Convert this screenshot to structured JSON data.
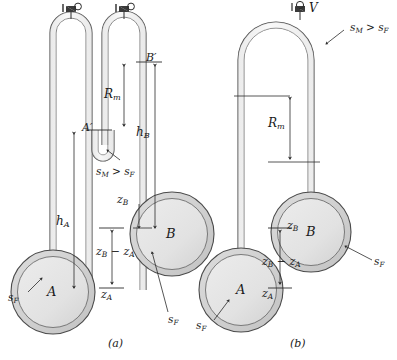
{
  "figure": {
    "title_caption_a": "(a)",
    "title_caption_b": "(b)",
    "fluid_note": "s_M > s_F",
    "valve_label": "V"
  },
  "panel_a": {
    "caption": "(a)",
    "spheres": [
      {
        "name": "sphere-a",
        "label": "A"
      },
      {
        "name": "sphere-b",
        "label": "B"
      }
    ],
    "labels": {
      "a_prime": "A′",
      "b_prime": "B′",
      "manometer_reading": "R",
      "manometer_reading_sub": "m",
      "h_a": "h",
      "h_a_sub": "A",
      "h_b": "h",
      "h_b_sub": "B",
      "z_b": "z",
      "z_b_sub": "B",
      "z_a": "z",
      "z_a_sub": "A",
      "z_diff": "z",
      "z_diff_sub1": "B",
      "z_diff_minus": " − ",
      "z_diff_z2": "z",
      "z_diff_sub2": "A",
      "s_m_gt_s_f_first": "s",
      "s_m_gt_s_f_sub1": "M",
      "s_m_gt_s_f_mid": " > ",
      "s_m_gt_s_f_second": "s",
      "s_m_gt_s_f_sub2": "F",
      "s_f_left": "s",
      "s_f_left_sub": "F",
      "s_f_right": "s",
      "s_f_right_sub": "F"
    }
  },
  "panel_b": {
    "caption": "(b)",
    "spheres": [
      {
        "name": "sphere-a",
        "label": "A"
      },
      {
        "name": "sphere-b",
        "label": "B"
      }
    ],
    "labels": {
      "valve": "V",
      "manometer_reading": "R",
      "manometer_reading_sub": "m",
      "z_b": "z",
      "z_b_sub": "B",
      "z_a": "z",
      "z_a_sub": "A",
      "z_diff": "z",
      "z_diff_sub1": "B",
      "z_diff_minus": " − ",
      "z_diff_z2": "z",
      "z_diff_sub2": "A",
      "s_m_gt_s_f_first": "s",
      "s_m_gt_s_f_sub1": "M",
      "s_m_gt_s_f_mid": " > ",
      "s_m_gt_s_f_second": "s",
      "s_m_gt_s_f_sub2": "F",
      "s_f_left": "s",
      "s_f_left_sub": "F",
      "s_f_right": "s",
      "s_f_right_sub": "F"
    }
  },
  "colors": {
    "line": "#3a3a3a",
    "fill_sphere": "#e3e3e3",
    "fill_ring": "#d2d2d2",
    "tube_fill": "#ececec",
    "background": "#ffffff",
    "text": "#1a1a1a"
  }
}
